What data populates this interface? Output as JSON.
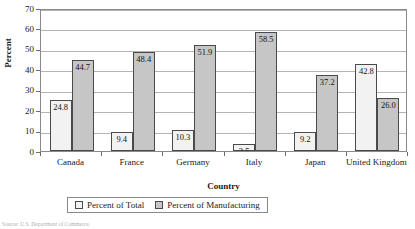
{
  "chart_data": {
    "type": "bar",
    "title": "",
    "xlabel": "Country",
    "ylabel": "Percent",
    "categories": [
      "Canada",
      "France",
      "Germany",
      "Italy",
      "Japan",
      "United Kingdom"
    ],
    "series": [
      {
        "name": "Percent of Total",
        "values": [
          24.8,
          9.4,
          10.3,
          3.5,
          9.2,
          42.8
        ],
        "color": "#f2f2f2"
      },
      {
        "name": "Percent of Manufacturing",
        "values": [
          44.7,
          48.4,
          51.9,
          58.5,
          37.2,
          26.0
        ],
        "color": "#c6c6c6"
      }
    ],
    "ylim": [
      0,
      70
    ],
    "yticks": [
      0,
      10,
      20,
      30,
      40,
      50,
      60,
      70
    ],
    "ytick_labels": [
      "0",
      "10",
      "20",
      "30",
      "40",
      "50",
      "60",
      "70"
    ],
    "grid": true,
    "grid_axis": "y",
    "legend_position": "bottom",
    "data_labels": true,
    "bar_border_color": "#4a4a4a",
    "frame_color": "#8a8a8a"
  },
  "axes": {
    "y_title": "Percent",
    "x_title": "Country"
  },
  "legend": {
    "entries": [
      {
        "label": "Percent of Total"
      },
      {
        "label": "Percent of Manufacturing"
      }
    ]
  },
  "source_note": "Source: U.S. Department of Commerce."
}
